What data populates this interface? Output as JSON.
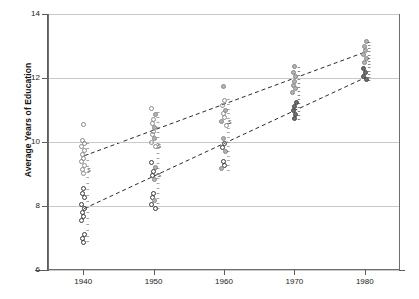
{
  "chart_data": {
    "type": "scatter",
    "title": "",
    "xlabel": "",
    "ylabel": "Average Years of Education",
    "xlim": [
      1935,
      1985
    ],
    "ylim": [
      6,
      14
    ],
    "xticks": [
      1940,
      1950,
      1960,
      1970,
      1980
    ],
    "yticks": [
      6,
      8,
      10,
      12,
      14
    ],
    "grid": true,
    "legend": "none",
    "series": [
      {
        "name": "upper-group",
        "marker": "open-circle-light",
        "trendline": {
          "style": "dashed",
          "x": [
            1940,
            1980
          ],
          "y": [
            9.6,
            12.85
          ]
        },
        "points": [
          {
            "x": 1940,
            "y": 10.55,
            "label": ""
          },
          {
            "x": 1940,
            "y": 10.05,
            "label": ""
          },
          {
            "x": 1940,
            "y": 9.95,
            "label": ""
          },
          {
            "x": 1940,
            "y": 9.85,
            "label": ""
          },
          {
            "x": 1940,
            "y": 9.75,
            "label": ""
          },
          {
            "x": 1940,
            "y": 9.62,
            "label": ""
          },
          {
            "x": 1940,
            "y": 9.5,
            "label": ""
          },
          {
            "x": 1940,
            "y": 9.38,
            "label": ""
          },
          {
            "x": 1940,
            "y": 9.26,
            "label": ""
          },
          {
            "x": 1940,
            "y": 9.14,
            "label": "S"
          },
          {
            "x": 1940,
            "y": 9.02,
            "label": ""
          },
          {
            "x": 1950,
            "y": 11.05,
            "label": ""
          },
          {
            "x": 1950,
            "y": 10.85,
            "label": ""
          },
          {
            "x": 1950,
            "y": 10.7,
            "label": ""
          },
          {
            "x": 1950,
            "y": 10.58,
            "label": ""
          },
          {
            "x": 1950,
            "y": 10.46,
            "label": ""
          },
          {
            "x": 1950,
            "y": 10.34,
            "label": ""
          },
          {
            "x": 1950,
            "y": 10.22,
            "label": ""
          },
          {
            "x": 1950,
            "y": 10.1,
            "label": ""
          },
          {
            "x": 1950,
            "y": 9.98,
            "label": ""
          },
          {
            "x": 1950,
            "y": 9.86,
            "label": "S"
          },
          {
            "x": 1960,
            "y": 11.75,
            "label": ""
          },
          {
            "x": 1960,
            "y": 11.3,
            "label": ""
          },
          {
            "x": 1960,
            "y": 11.15,
            "label": ""
          },
          {
            "x": 1960,
            "y": 11.0,
            "label": ""
          },
          {
            "x": 1960,
            "y": 10.88,
            "label": ""
          },
          {
            "x": 1960,
            "y": 10.76,
            "label": ""
          },
          {
            "x": 1960,
            "y": 10.64,
            "label": "S"
          },
          {
            "x": 1960,
            "y": 10.52,
            "label": ""
          },
          {
            "x": 1970,
            "y": 12.35,
            "label": ""
          },
          {
            "x": 1970,
            "y": 12.18,
            "label": ""
          },
          {
            "x": 1970,
            "y": 12.04,
            "label": ""
          },
          {
            "x": 1970,
            "y": 11.9,
            "label": ""
          },
          {
            "x": 1970,
            "y": 11.78,
            "label": ""
          },
          {
            "x": 1970,
            "y": 11.66,
            "label": ""
          },
          {
            "x": 1970,
            "y": 11.54,
            "label": ""
          },
          {
            "x": 1980,
            "y": 13.15,
            "label": ""
          },
          {
            "x": 1980,
            "y": 12.98,
            "label": ""
          },
          {
            "x": 1980,
            "y": 12.86,
            "label": ""
          },
          {
            "x": 1980,
            "y": 12.74,
            "label": ""
          },
          {
            "x": 1980,
            "y": 12.62,
            "label": ""
          },
          {
            "x": 1980,
            "y": 12.5,
            "label": ""
          }
        ]
      },
      {
        "name": "lower-group",
        "marker": "open-circle-dark",
        "trendline": {
          "style": "dashed",
          "x": [
            1940,
            1980
          ],
          "y": [
            7.95,
            12.05
          ]
        },
        "points": [
          {
            "x": 1940,
            "y": 8.55,
            "label": ""
          },
          {
            "x": 1940,
            "y": 8.4,
            "label": ""
          },
          {
            "x": 1940,
            "y": 8.28,
            "label": ""
          },
          {
            "x": 1940,
            "y": 8.05,
            "label": ""
          },
          {
            "x": 1940,
            "y": 7.92,
            "label": ""
          },
          {
            "x": 1940,
            "y": 7.8,
            "label": ""
          },
          {
            "x": 1940,
            "y": 7.68,
            "label": ""
          },
          {
            "x": 1940,
            "y": 7.56,
            "label": ""
          },
          {
            "x": 1940,
            "y": 7.1,
            "label": ""
          },
          {
            "x": 1940,
            "y": 6.98,
            "label": ""
          },
          {
            "x": 1940,
            "y": 6.86,
            "label": ""
          },
          {
            "x": 1950,
            "y": 9.35,
            "label": ""
          },
          {
            "x": 1950,
            "y": 9.2,
            "label": ""
          },
          {
            "x": 1950,
            "y": 9.08,
            "label": ""
          },
          {
            "x": 1950,
            "y": 8.96,
            "label": "S"
          },
          {
            "x": 1950,
            "y": 8.84,
            "label": ""
          },
          {
            "x": 1950,
            "y": 8.4,
            "label": ""
          },
          {
            "x": 1950,
            "y": 8.28,
            "label": ""
          },
          {
            "x": 1950,
            "y": 8.16,
            "label": ""
          },
          {
            "x": 1950,
            "y": 8.04,
            "label": ""
          },
          {
            "x": 1950,
            "y": 7.92,
            "label": ""
          },
          {
            "x": 1960,
            "y": 10.1,
            "label": ""
          },
          {
            "x": 1960,
            "y": 9.95,
            "label": ""
          },
          {
            "x": 1960,
            "y": 9.83,
            "label": ""
          },
          {
            "x": 1960,
            "y": 9.71,
            "label": ""
          },
          {
            "x": 1960,
            "y": 9.4,
            "label": ""
          },
          {
            "x": 1960,
            "y": 9.28,
            "label": ""
          },
          {
            "x": 1960,
            "y": 9.16,
            "label": ""
          },
          {
            "x": 1970,
            "y": 11.25,
            "label": ""
          },
          {
            "x": 1970,
            "y": 11.1,
            "label": ""
          },
          {
            "x": 1970,
            "y": 10.98,
            "label": ""
          },
          {
            "x": 1970,
            "y": 10.86,
            "label": ""
          },
          {
            "x": 1970,
            "y": 10.74,
            "label": ""
          },
          {
            "x": 1980,
            "y": 12.3,
            "label": ""
          },
          {
            "x": 1980,
            "y": 12.18,
            "label": ""
          },
          {
            "x": 1980,
            "y": 12.06,
            "label": ""
          },
          {
            "x": 1980,
            "y": 11.94,
            "label": ""
          }
        ]
      }
    ],
    "point_annotations": [
      {
        "x": 1940,
        "y": 9.14,
        "text": "S"
      },
      {
        "x": 1950,
        "y": 9.86,
        "text": "S"
      },
      {
        "x": 1950,
        "y": 8.96,
        "text": "S"
      },
      {
        "x": 1960,
        "y": 10.64,
        "text": "S"
      }
    ]
  }
}
